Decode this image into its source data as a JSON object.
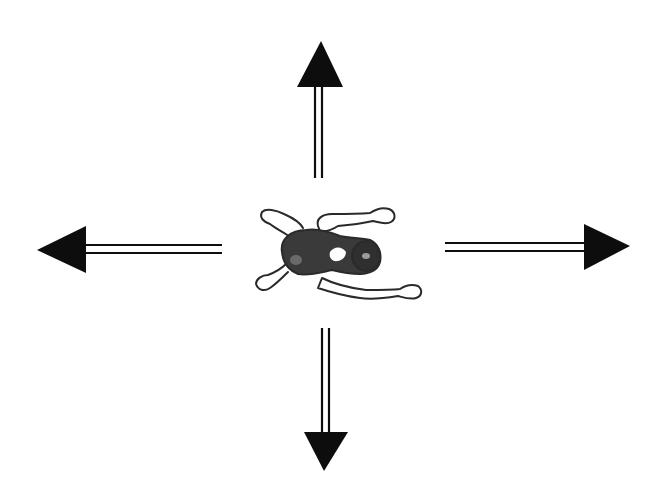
{
  "diagram": {
    "colors": {
      "background": "#ffffff",
      "arrow": "#0d0d0d",
      "figure_outline": "#2a2a2a",
      "figure_body": "#3a3a3a",
      "figure_skin": "#ffffff"
    },
    "center_figure": {
      "name": "swimmer-figure",
      "cx": 340,
      "cy": 253
    },
    "arrows": [
      {
        "name": "arrow-up",
        "direction": "up",
        "head": [
          [
            321,
            41
          ],
          [
            297,
            87
          ],
          [
            343,
            87
          ]
        ],
        "shaft": [
          [
            315,
            87,
            315,
            178
          ],
          [
            322,
            87,
            322,
            178
          ]
        ]
      },
      {
        "name": "arrow-left",
        "direction": "left",
        "head": [
          [
            37,
            250
          ],
          [
            86,
            226
          ],
          [
            86,
            273
          ]
        ],
        "shaft": [
          [
            86,
            245,
            222,
            245
          ],
          [
            86,
            253,
            222,
            253
          ]
        ]
      },
      {
        "name": "arrow-right",
        "direction": "right",
        "head": [
          [
            630,
            246
          ],
          [
            584,
            224
          ],
          [
            584,
            270
          ]
        ],
        "shaft": [
          [
            445,
            243,
            585,
            243
          ],
          [
            445,
            251,
            585,
            251
          ]
        ]
      },
      {
        "name": "arrow-down",
        "direction": "down",
        "head": [
          [
            324,
            471
          ],
          [
            304,
            432
          ],
          [
            348,
            432
          ]
        ],
        "shaft": [
          [
            322,
            328,
            322,
            433
          ],
          [
            329,
            328,
            329,
            433
          ]
        ]
      }
    ]
  }
}
